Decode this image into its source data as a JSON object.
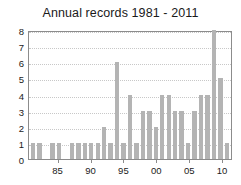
{
  "chart_data": {
    "type": "bar",
    "title": "Annual records 1981 - 2011",
    "xlabel": "",
    "ylabel": "",
    "ylim": [
      0,
      8
    ],
    "yticks": [
      0,
      1,
      2,
      3,
      4,
      5,
      6,
      7,
      8
    ],
    "grid": true,
    "legend": false,
    "bar_color": "#b4b4b4",
    "categories": [
      "81",
      "82",
      "83",
      "84",
      "85",
      "86",
      "87",
      "88",
      "89",
      "90",
      "91",
      "92",
      "93",
      "94",
      "95",
      "96",
      "97",
      "98",
      "99",
      "00",
      "01",
      "02",
      "03",
      "04",
      "05",
      "06",
      "07",
      "08",
      "09",
      "10",
      "11"
    ],
    "x": [
      1981,
      1982,
      1983,
      1984,
      1985,
      1986,
      1987,
      1988,
      1989,
      1990,
      1991,
      1992,
      1993,
      1994,
      1995,
      1996,
      1997,
      1998,
      1999,
      2000,
      2001,
      2002,
      2003,
      2004,
      2005,
      2006,
      2007,
      2008,
      2009,
      2010,
      2011
    ],
    "values": [
      1,
      1,
      0,
      1,
      1,
      0,
      1,
      1,
      1,
      1,
      1,
      2,
      1,
      6,
      1,
      4,
      1,
      3,
      3,
      2,
      4,
      4,
      3,
      3,
      1,
      3,
      4,
      4,
      8,
      5,
      1
    ],
    "xticks": [
      {
        "label": "85",
        "value": 1985
      },
      {
        "label": "90",
        "value": 1990
      },
      {
        "label": "95",
        "value": 1995
      },
      {
        "label": "00",
        "value": 2000
      },
      {
        "label": "05",
        "value": 2005
      },
      {
        "label": "10",
        "value": 2010
      }
    ]
  }
}
